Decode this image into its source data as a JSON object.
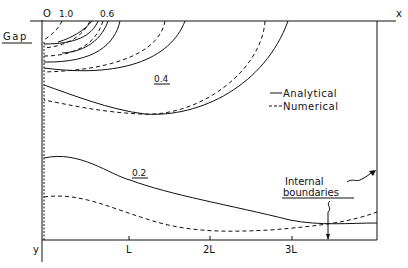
{
  "figure": {
    "axis_labels": {
      "x": "x",
      "y": "y",
      "origin": "O"
    },
    "gap_label": "Gap",
    "top_labels": [
      "1.0",
      "0.6"
    ],
    "contour_labels": [
      "0.4",
      "0.2"
    ],
    "x_ticks": [
      "L",
      "2L",
      "3L"
    ],
    "legend": {
      "analytical": "Analytical",
      "numerical": "Numerical"
    },
    "annotation": {
      "line1": "Internal",
      "line2": "boundaries"
    },
    "colors": {
      "ink": "#111111",
      "background": "#ffffff"
    }
  }
}
